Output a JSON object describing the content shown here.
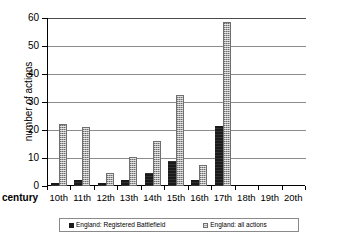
{
  "chart_data": {
    "type": "bar",
    "title": "",
    "xlabel": "century",
    "ylabel": "number of actions",
    "categories": [
      "10th",
      "11th",
      "12th",
      "13th",
      "14th",
      "15th",
      "16th",
      "17th",
      "18th",
      "19th",
      "20th"
    ],
    "series": [
      {
        "name": "England: Registered Battlefield",
        "color": "#1a1a1a",
        "values": [
          1,
          2,
          1,
          2,
          4.5,
          9,
          2,
          21.5,
          0,
          0,
          0
        ]
      },
      {
        "name": "England: all actions",
        "color": "#a8a8a8",
        "values": [
          22,
          21,
          4.5,
          10.5,
          16,
          32.5,
          7.5,
          58.5,
          0,
          0,
          0
        ]
      }
    ],
    "ylim": [
      0,
      60
    ],
    "yticks": [
      0,
      10,
      20,
      30,
      40,
      50,
      60
    ],
    "ytick_labels": [
      "0",
      "10",
      "20",
      "30",
      "40",
      "50",
      "60"
    ],
    "grid": true,
    "grid_axis": "y",
    "legend_position": "bottom"
  },
  "axes": {
    "y_title": "number of actions",
    "x_title": "century"
  },
  "legend": {
    "entries": [
      {
        "label": "England: Registered Battlefield",
        "marker": "dark-square-swatch"
      },
      {
        "label": "England: all actions",
        "marker": "grey-square-swatch"
      }
    ]
  }
}
